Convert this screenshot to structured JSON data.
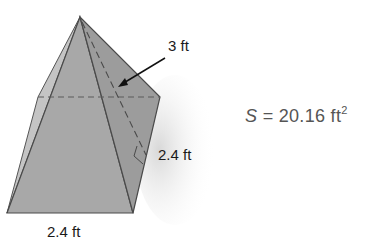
{
  "figure": {
    "type": "square-pyramid",
    "labels": {
      "slant_height": "3 ft",
      "base_side_right": "2.4 ft",
      "base_side_bottom": "2.4 ft"
    },
    "formula": {
      "variable": "S",
      "equals": "=",
      "value": "20.16",
      "unit": "ft",
      "exponent": "2"
    },
    "colors": {
      "face_front": "#a9a9a9",
      "face_right": "#9d9d9d",
      "face_left": "#c2c2c2",
      "edge": "#4a4a4a",
      "text": "#1a1a1a",
      "formula_text": "#555555"
    }
  }
}
